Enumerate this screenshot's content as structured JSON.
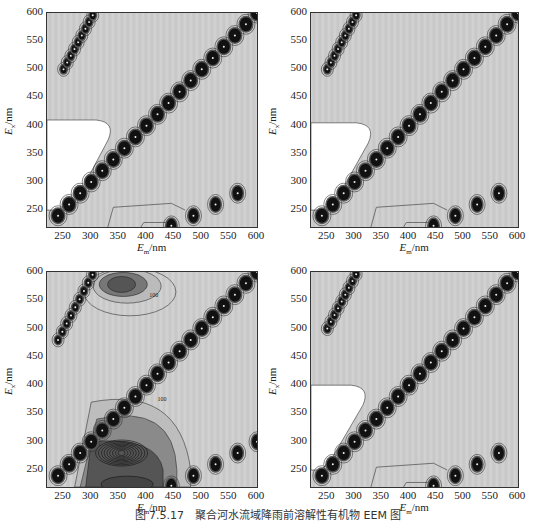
{
  "caption": "图 7.5.17　聚合河水流域降雨前溶解性有机物 EEM 图",
  "axes": {
    "x_label_main": "E",
    "x_label_sub": "m",
    "x_label_unit": "/nm",
    "y_label_main": "E",
    "y_label_sub": "x",
    "y_label_unit": "/nm",
    "x_ticks": [
      "250",
      "300",
      "350",
      "400",
      "450",
      "500",
      "550",
      "600"
    ],
    "y_ticks": [
      "600",
      "550",
      "500",
      "450",
      "400",
      "350",
      "300",
      "250"
    ]
  },
  "contour_label": "100",
  "chart_data": [
    {
      "type": "heatmap",
      "panel": "top-left",
      "title": "",
      "xlabel": "Em/nm",
      "ylabel": "Ex/nm",
      "xlim": [
        220,
        600
      ],
      "ylim": [
        220,
        600
      ],
      "x_ticks": [
        250,
        300,
        350,
        400,
        450,
        500,
        550,
        600
      ],
      "y_ticks": [
        250,
        300,
        350,
        400,
        450,
        500,
        550,
        600
      ],
      "features": [
        {
          "name": "first-order Rayleigh scatter line",
          "from": [
            240,
            240
          ],
          "to": [
            600,
            600
          ]
        },
        {
          "name": "second-order scatter line",
          "from": [
            250,
            500
          ],
          "to": [
            305,
            600
          ]
        },
        {
          "name": "Raman/scatter spots",
          "points": [
            [
              445,
              222
            ],
            [
              485,
              240
            ],
            [
              525,
              260
            ],
            [
              565,
              280
            ]
          ]
        },
        {
          "name": "low-intensity white region",
          "x_range": [
            220,
            345
          ],
          "y_range": [
            250,
            410
          ]
        }
      ],
      "grid": false,
      "legend": null
    },
    {
      "type": "heatmap",
      "panel": "top-right",
      "xlabel": "Em/nm",
      "ylabel": "Ex/nm",
      "xlim": [
        220,
        600
      ],
      "ylim": [
        220,
        600
      ],
      "x_ticks": [
        250,
        300,
        350,
        400,
        450,
        500,
        550,
        600
      ],
      "y_ticks": [
        250,
        300,
        350,
        400,
        450,
        500,
        550,
        600
      ],
      "features": [
        {
          "name": "first-order Rayleigh scatter line",
          "from": [
            240,
            240
          ],
          "to": [
            600,
            600
          ]
        },
        {
          "name": "second-order scatter line",
          "from": [
            250,
            500
          ],
          "to": [
            305,
            600
          ]
        },
        {
          "name": "Raman/scatter spots",
          "points": [
            [
              445,
              222
            ],
            [
              485,
              240
            ],
            [
              525,
              260
            ],
            [
              565,
              280
            ]
          ]
        },
        {
          "name": "low-intensity white region",
          "x_range": [
            220,
            340
          ],
          "y_range": [
            250,
            405
          ]
        }
      ],
      "grid": false,
      "legend": null
    },
    {
      "type": "heatmap",
      "panel": "bottom-left",
      "xlabel": "Em/nm",
      "ylabel": "Ex/nm",
      "xlim": [
        220,
        600
      ],
      "ylim": [
        220,
        600
      ],
      "x_ticks": [
        250,
        300,
        350,
        400,
        450,
        500,
        550,
        600
      ],
      "y_ticks": [
        250,
        300,
        350,
        400,
        450,
        500,
        550,
        600
      ],
      "features": [
        {
          "name": "first-order Rayleigh scatter line",
          "from": [
            240,
            240
          ],
          "to": [
            600,
            600
          ]
        },
        {
          "name": "second-order scatter line",
          "from": [
            240,
            480
          ],
          "to": [
            305,
            600
          ]
        },
        {
          "name": "fluorescence peak (high intensity)",
          "center": [
            355,
            280
          ],
          "contour_levels": "dense"
        },
        {
          "name": "fluorescence peak",
          "center": [
            355,
            575
          ]
        },
        {
          "name": "broad humic region",
          "x_range": [
            300,
            480
          ],
          "y_range": [
            220,
            370
          ]
        },
        {
          "name": "contour label",
          "value": 100,
          "positions": [
            [
              420,
              360
            ],
            [
              400,
              560
            ],
            [
              470,
              260
            ]
          ]
        },
        {
          "name": "Raman/scatter spots",
          "points": [
            [
              445,
              222
            ],
            [
              485,
              240
            ],
            [
              525,
              260
            ],
            [
              565,
              280
            ],
            [
              600,
              300
            ]
          ]
        }
      ],
      "grid": false,
      "legend": null
    },
    {
      "type": "heatmap",
      "panel": "bottom-right",
      "xlabel": "Em/nm",
      "ylabel": "Ex/nm",
      "xlim": [
        220,
        600
      ],
      "ylim": [
        220,
        600
      ],
      "x_ticks": [
        250,
        300,
        350,
        400,
        450,
        500,
        550,
        600
      ],
      "y_ticks": [
        250,
        300,
        350,
        400,
        450,
        500,
        550,
        600
      ],
      "features": [
        {
          "name": "first-order Rayleigh scatter line",
          "from": [
            240,
            240
          ],
          "to": [
            600,
            600
          ]
        },
        {
          "name": "second-order scatter line",
          "from": [
            250,
            500
          ],
          "to": [
            305,
            600
          ]
        },
        {
          "name": "Raman/scatter spots",
          "points": [
            [
              445,
              222
            ],
            [
              485,
              240
            ],
            [
              525,
              260
            ],
            [
              565,
              280
            ]
          ]
        },
        {
          "name": "low-intensity white region",
          "x_range": [
            220,
            330
          ],
          "y_range": [
            250,
            400
          ]
        }
      ],
      "grid": false,
      "legend": null
    }
  ]
}
